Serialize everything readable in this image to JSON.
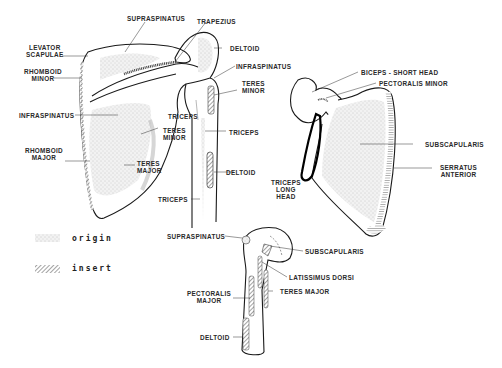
{
  "colors": {
    "line": "#1a1a1a",
    "origin_fill": "#d9d9d9",
    "insert_hatch": "#444444",
    "text": "#2a2a2a"
  },
  "posterior_scapula": {
    "labels": {
      "supraspinatus": "SUPRASPINATUS",
      "trapezius": "TRAPEZIUS",
      "levator_scapulae": [
        "LEVATOR",
        "SCAPULAE"
      ],
      "deltoid_top": "DELTOID",
      "rhomboid_minor": [
        "RHOMBOID",
        "MINOR"
      ],
      "infraspinatus_right": "INFRASPINATUS",
      "teres_minor_right": [
        "TERES",
        "MINOR"
      ],
      "infraspinatus_left": "INFRASPINATUS",
      "triceps_upper": "TRICEPS",
      "teres_minor_left": [
        "TERES",
        "MINOR"
      ],
      "triceps_right": "TRICEPS",
      "rhomboid_major": [
        "RHOMBOID",
        "MAJOR"
      ],
      "teres_major": [
        "TERES",
        "MAJOR"
      ],
      "deltoid_mid": "DELTOID",
      "triceps_bottom": "TRICEPS"
    }
  },
  "anterior_scapula": {
    "labels": {
      "biceps_short_head": "BICEPS - SHORT HEAD",
      "pectoralis_minor": "PECTORALIS MINOR",
      "subscapularis": "SUBSCAPULARIS",
      "serratus_anterior": [
        "SERRATUS",
        "ANTERIOR"
      ],
      "triceps_long_head": [
        "TRICEPS",
        "LONG",
        "HEAD"
      ]
    }
  },
  "humerus": {
    "labels": {
      "supraspinatus": "SUPRASPINATUS",
      "subscapularis": "SUBSCAPULARIS",
      "latissimus_dorsi": "LATISSIMUS DORSI",
      "pectoralis_major": [
        "PECTORALIS",
        "MAJOR"
      ],
      "teres_major": "TERES MAJOR",
      "deltoid": "DELTOID"
    }
  },
  "legend": [
    {
      "pattern": "stipple",
      "label": "origin"
    },
    {
      "pattern": "hatch",
      "label": "insert"
    }
  ]
}
